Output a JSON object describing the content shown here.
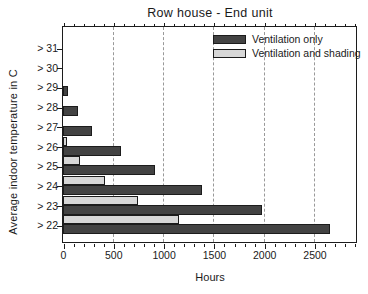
{
  "title": "Row house - End unit",
  "axes": {
    "x_label": "Hours",
    "y_label": "Average indoor temperature in C"
  },
  "legend": {
    "items": [
      {
        "label": "Ventilation only",
        "color": "#434343"
      },
      {
        "label": "Ventilation and shading",
        "color": "#d7d7d7"
      }
    ]
  },
  "chart_data": {
    "type": "bar",
    "orientation": "horizontal",
    "title": "Row house - End unit",
    "xlabel": "Hours",
    "ylabel": "Average indoor temperature in C",
    "categories": [
      "> 31",
      "> 30",
      "> 29",
      "> 28",
      "> 27",
      "> 26",
      "> 25",
      "> 24",
      "> 23",
      "> 22"
    ],
    "series": [
      {
        "name": "Ventilation only",
        "color": "#434343",
        "border_color": "#1c1c1c",
        "values": [
          0,
          0,
          50,
          150,
          290,
          580,
          910,
          1380,
          1980,
          2650
        ]
      },
      {
        "name": "Ventilation and shading",
        "color": "#d7d7d7",
        "border_color": "#1c1c1c",
        "values": [
          0,
          0,
          0,
          0,
          0,
          40,
          170,
          420,
          750,
          1150
        ]
      }
    ],
    "xlim": [
      0,
      2900
    ],
    "x_ticks": [
      0,
      500,
      1000,
      1500,
      2000,
      2500
    ],
    "x_minor_tick_interval": 100,
    "grid": "vertical-dashed",
    "grid_color": "#999999",
    "legend_position": "top-right",
    "axis_color": "#1c1c1c",
    "background": "#ffffff"
  }
}
